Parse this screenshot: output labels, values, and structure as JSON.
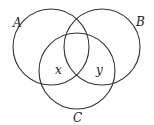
{
  "diagram": {
    "type": "venn",
    "background": "#ffffff",
    "stroke_color": "#333333",
    "circles": [
      {
        "id": "A",
        "label": "A",
        "cx": 51,
        "cy": 47,
        "r": 38,
        "label_x": 13,
        "label_y": 27
      },
      {
        "id": "B",
        "label": "B",
        "cx": 102,
        "cy": 47,
        "r": 38,
        "label_x": 136,
        "label_y": 26
      },
      {
        "id": "C",
        "label": "C",
        "cx": 77,
        "cy": 71,
        "r": 38,
        "label_x": 73,
        "label_y": 122
      }
    ],
    "region_labels": [
      {
        "id": "x",
        "text": "x",
        "region": "A ∩ C only",
        "x": 55,
        "y": 74
      },
      {
        "id": "y",
        "text": "y",
        "region": "B ∩ C only",
        "x": 96,
        "y": 74
      }
    ]
  }
}
